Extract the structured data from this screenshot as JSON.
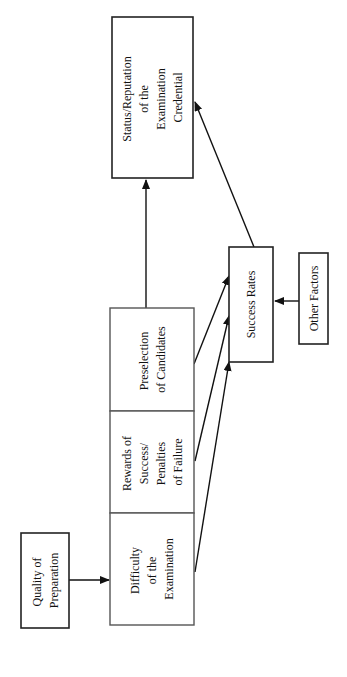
{
  "diagram": {
    "orientation": "rotated-90-ccw",
    "nodes": {
      "status": {
        "lines": [
          "Status/Reputation",
          "of the",
          "Examination",
          "Credential"
        ]
      },
      "preselection": {
        "lines": [
          "Preselection",
          "of Candidates"
        ]
      },
      "rewards": {
        "lines": [
          "Rewards of",
          "Success/",
          "Penalties",
          "of Failure"
        ]
      },
      "difficulty": {
        "lines": [
          "Difficulty",
          "of the",
          "Examination"
        ]
      },
      "quality": {
        "lines": [
          "Quality of",
          "Preparation"
        ]
      },
      "success": {
        "lines": [
          "Success Rates"
        ]
      },
      "other": {
        "lines": [
          "Other Factors"
        ]
      }
    },
    "edges": [
      {
        "from": "quality",
        "to": "difficulty"
      },
      {
        "from": "preselection",
        "to": "status"
      },
      {
        "from": "preselection",
        "to": "success"
      },
      {
        "from": "rewards",
        "to": "success"
      },
      {
        "from": "difficulty",
        "to": "success"
      },
      {
        "from": "other",
        "to": "success"
      },
      {
        "from": "success",
        "to": "status"
      }
    ]
  }
}
